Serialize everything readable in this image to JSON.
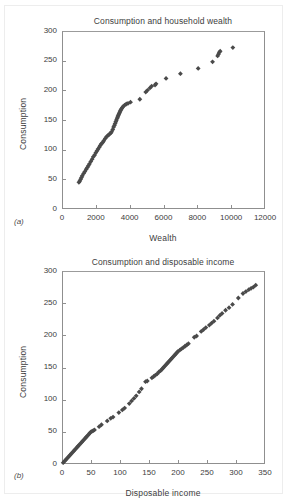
{
  "figure": {
    "background": "#ffffff",
    "marker_color": "#4a4a4a",
    "axis_color": "#8f8f8f",
    "text_color": "#3d3d3d"
  },
  "panels": [
    {
      "key": "a",
      "panel_label": "(a)",
      "title": "Consumption and household wealth"
    },
    {
      "key": "b",
      "panel_label": "(b)",
      "title": "Consumption and disposable income"
    }
  ],
  "chart_data": [
    {
      "type": "scatter",
      "panel": "(a)",
      "title": "Consumption and household wealth",
      "xlabel": "Wealth",
      "ylabel": "Consumption",
      "xlim": [
        0,
        12000
      ],
      "ylim": [
        0,
        300
      ],
      "xticks": [
        0,
        2000,
        4000,
        6000,
        8000,
        10000,
        12000
      ],
      "yticks": [
        0,
        50,
        100,
        150,
        200,
        250,
        300
      ],
      "grid": false,
      "legend": "none",
      "marker": "diamond",
      "marker_color": "#4a4a4a",
      "points": [
        [
          1000,
          45
        ],
        [
          1050,
          47
        ],
        [
          1100,
          50
        ],
        [
          1150,
          53
        ],
        [
          1200,
          56
        ],
        [
          1280,
          60
        ],
        [
          1350,
          63
        ],
        [
          1430,
          67
        ],
        [
          1500,
          70
        ],
        [
          1560,
          73
        ],
        [
          1620,
          76
        ],
        [
          1700,
          80
        ],
        [
          1780,
          84
        ],
        [
          1850,
          88
        ],
        [
          1930,
          91
        ],
        [
          2000,
          95
        ],
        [
          2070,
          98
        ],
        [
          2130,
          101
        ],
        [
          2200,
          104
        ],
        [
          2260,
          107
        ],
        [
          2330,
          110
        ],
        [
          2400,
          112
        ],
        [
          2470,
          115
        ],
        [
          2560,
          119
        ],
        [
          2640,
          122
        ],
        [
          2720,
          124
        ],
        [
          2800,
          126
        ],
        [
          2880,
          128
        ],
        [
          2930,
          130
        ],
        [
          3000,
          134
        ],
        [
          3050,
          138
        ],
        [
          3100,
          141
        ],
        [
          3140,
          144
        ],
        [
          3180,
          147
        ],
        [
          3220,
          150
        ],
        [
          3260,
          153
        ],
        [
          3290,
          155
        ],
        [
          3320,
          157
        ],
        [
          3350,
          159
        ],
        [
          3380,
          161
        ],
        [
          3410,
          163
        ],
        [
          3440,
          165
        ],
        [
          3480,
          167
        ],
        [
          3520,
          169
        ],
        [
          3570,
          171
        ],
        [
          3620,
          173
        ],
        [
          3700,
          175
        ],
        [
          3800,
          177
        ],
        [
          3900,
          178
        ],
        [
          4050,
          180
        ],
        [
          4600,
          185
        ],
        [
          4950,
          197
        ],
        [
          5050,
          200
        ],
        [
          5200,
          204
        ],
        [
          5300,
          207
        ],
        [
          5500,
          209
        ],
        [
          5560,
          211
        ],
        [
          6150,
          220
        ],
        [
          7000,
          228
        ],
        [
          8050,
          237
        ],
        [
          8900,
          248
        ],
        [
          9200,
          258
        ],
        [
          9250,
          261
        ],
        [
          9300,
          264
        ],
        [
          9350,
          266
        ],
        [
          10100,
          272
        ]
      ]
    },
    {
      "type": "scatter",
      "panel": "(b)",
      "title": "Consumption and disposable income",
      "xlabel": "Disposable income",
      "ylabel": "Consumption",
      "xlim": [
        0,
        350
      ],
      "ylim": [
        0,
        300
      ],
      "xticks": [
        0,
        50,
        100,
        150,
        200,
        250,
        300,
        350
      ],
      "yticks": [
        0,
        50,
        100,
        150,
        200,
        250,
        300
      ],
      "grid": false,
      "legend": "none",
      "marker": "diamond",
      "marker_color": "#4a4a4a",
      "points": [
        [
          2,
          2
        ],
        [
          4,
          4
        ],
        [
          6,
          6
        ],
        [
          8,
          8
        ],
        [
          10,
          10
        ],
        [
          12,
          12
        ],
        [
          14,
          14
        ],
        [
          16,
          16
        ],
        [
          18,
          18
        ],
        [
          20,
          20
        ],
        [
          22,
          22
        ],
        [
          24,
          24
        ],
        [
          26,
          26
        ],
        [
          28,
          28
        ],
        [
          30,
          30
        ],
        [
          32,
          32
        ],
        [
          34,
          34
        ],
        [
          36,
          36
        ],
        [
          38,
          38
        ],
        [
          40,
          40
        ],
        [
          42,
          42
        ],
        [
          44,
          44
        ],
        [
          46,
          46
        ],
        [
          48,
          48
        ],
        [
          50,
          50
        ],
        [
          52,
          51
        ],
        [
          54,
          52
        ],
        [
          56,
          53
        ],
        [
          64,
          58
        ],
        [
          68,
          61
        ],
        [
          78,
          67
        ],
        [
          84,
          71
        ],
        [
          88,
          73
        ],
        [
          98,
          80
        ],
        [
          104,
          84
        ],
        [
          108,
          87
        ],
        [
          116,
          94
        ],
        [
          120,
          98
        ],
        [
          124,
          102
        ],
        [
          128,
          106
        ],
        [
          133,
          112
        ],
        [
          137,
          117
        ],
        [
          144,
          128
        ],
        [
          147,
          129
        ],
        [
          155,
          134
        ],
        [
          158,
          136
        ],
        [
          161,
          138
        ],
        [
          164,
          140
        ],
        [
          167,
          143
        ],
        [
          170,
          145
        ],
        [
          172,
          147
        ],
        [
          174,
          149
        ],
        [
          176,
          151
        ],
        [
          178,
          153
        ],
        [
          180,
          155
        ],
        [
          182,
          157
        ],
        [
          184,
          159
        ],
        [
          186,
          161
        ],
        [
          188,
          163
        ],
        [
          190,
          165
        ],
        [
          192,
          167
        ],
        [
          194,
          169
        ],
        [
          196,
          171
        ],
        [
          198,
          173
        ],
        [
          200,
          175
        ],
        [
          203,
          177
        ],
        [
          206,
          179
        ],
        [
          209,
          181
        ],
        [
          212,
          183
        ],
        [
          215,
          185
        ],
        [
          218,
          187
        ],
        [
          228,
          197
        ],
        [
          232,
          199
        ],
        [
          240,
          206
        ],
        [
          244,
          209
        ],
        [
          248,
          212
        ],
        [
          254,
          216
        ],
        [
          258,
          219
        ],
        [
          262,
          222
        ],
        [
          268,
          227
        ],
        [
          272,
          231
        ],
        [
          276,
          234
        ],
        [
          282,
          239
        ],
        [
          288,
          243
        ],
        [
          294,
          248
        ],
        [
          304,
          258
        ],
        [
          312,
          265
        ],
        [
          317,
          268
        ],
        [
          322,
          271
        ],
        [
          326,
          273
        ],
        [
          330,
          275
        ],
        [
          334,
          278
        ]
      ]
    }
  ]
}
